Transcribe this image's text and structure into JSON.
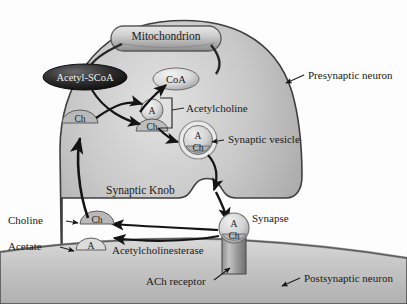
{
  "diagram": {
    "type": "biological-process-diagram",
    "palette": {
      "background": "#fdfdfd",
      "cytoplasm_light": "#d8d8d8",
      "cytoplasm_mid": "#b4b4b4",
      "cytoplasm_dark": "#9a9a9a",
      "membrane_line": "#4a4a4a",
      "postsynaptic_fill": "#c9c9c9",
      "molecule_light": "#e6e6e6",
      "molecule_dark": "#2a2a2a",
      "text": "#1a1a1a",
      "arrow": "#151515"
    }
  },
  "structures": {
    "mitochondrion": {
      "label": "Mitochondrion"
    },
    "acetyl_scoa": {
      "label": "Acetyl-SCoA"
    },
    "coa": {
      "label": "CoA"
    },
    "choline_molecule_inner": {
      "label": "Ch"
    },
    "acetylcholine_molecule": {
      "top": "A",
      "bottom": "Ch"
    },
    "synaptic_vesicle": {
      "top": "A",
      "bottom": "Ch"
    },
    "cleft_acetylcholine": {
      "top": "A",
      "bottom": "Ch"
    },
    "choline_recycled": {
      "label": "Ch"
    },
    "acetate_molecule": {
      "label": "A"
    }
  },
  "labels": {
    "presynaptic_neuron": "Presynaptic neuron",
    "acetylcholine": "Acetylcholine",
    "synaptic_vesicle": "Synaptic vesicle",
    "synaptic_knob": "Synaptic Knob",
    "synapse": "Synapse",
    "choline": "Choline",
    "acetate": "Acetate",
    "acetylcholinesterase": "Acetylcholinesterase",
    "ach_receptor": "ACh receptor",
    "postsynaptic_neuron": "Postsynaptic neuron"
  }
}
